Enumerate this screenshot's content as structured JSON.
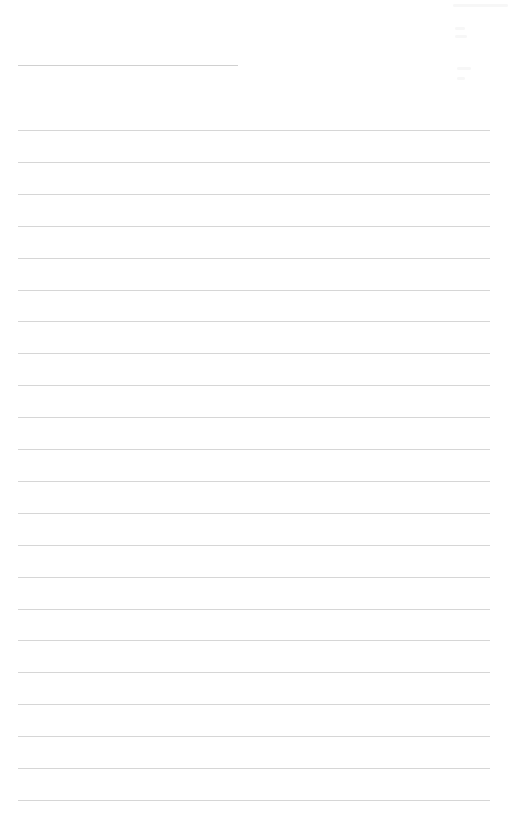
{
  "page": {
    "type": "lined-paper",
    "background_color": "#ffffff",
    "rule_color": "#d6d6d6",
    "header_rule": {
      "top": 65,
      "left": 18,
      "width": 220
    },
    "body_rules": {
      "count": 22,
      "first_top": 130,
      "spacing": 31.9,
      "left": 18,
      "right": 490
    }
  }
}
